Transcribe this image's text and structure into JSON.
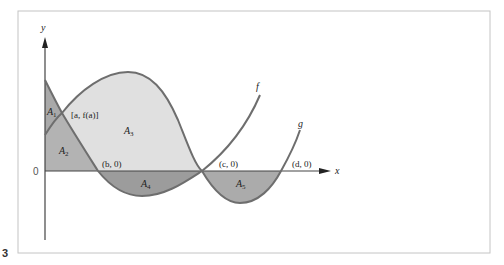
{
  "figure": {
    "page_marker": "3",
    "axes": {
      "x_label": "x",
      "y_label": "y",
      "origin_label": "0"
    },
    "curves": [
      {
        "name": "f",
        "label": "f"
      },
      {
        "name": "g",
        "label": "g"
      }
    ],
    "points": {
      "a": "[a, f(a)]",
      "b": "(b, 0)",
      "c": "(c, 0)",
      "d": "(d, 0)"
    },
    "regions": [
      {
        "id": "A1",
        "base": "A",
        "sub": "1",
        "color": "#a9a9a9"
      },
      {
        "id": "A2",
        "base": "A",
        "sub": "2",
        "color": "#b3b3b3"
      },
      {
        "id": "A3",
        "base": "A",
        "sub": "3",
        "color": "#e0e0e0"
      },
      {
        "id": "A4",
        "base": "A",
        "sub": "4",
        "color": "#9c9c9c"
      },
      {
        "id": "A5",
        "base": "A",
        "sub": "5",
        "color": "#ababab"
      }
    ],
    "colors": {
      "curve": "#6e6e6e",
      "axis": "#444444",
      "frame": "#c4c4c4"
    }
  }
}
